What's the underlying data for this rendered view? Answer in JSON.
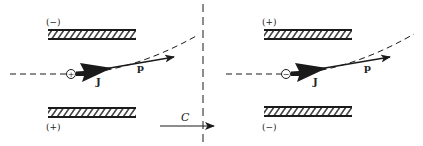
{
  "colors": {
    "ink": "#1a1a1a",
    "background": "#ffffff"
  },
  "left_panel": {
    "top_plate_label": "(−)",
    "bottom_plate_label": "(+)",
    "particle_sign": "+",
    "momentum_label": "p",
    "spin_label": "J"
  },
  "right_panel": {
    "top_plate_label": "(+)",
    "bottom_plate_label": "(−)",
    "particle_sign": "−",
    "momentum_label": "p",
    "spin_label": "J"
  },
  "mirror": {
    "operation_label": "C"
  }
}
